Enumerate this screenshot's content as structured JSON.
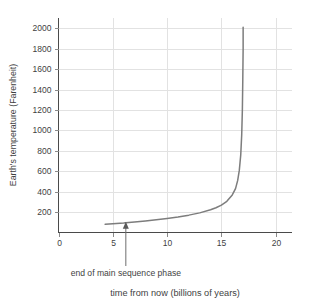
{
  "chart_data": {
    "type": "line",
    "title": "",
    "subtitle": "",
    "xlabel": "time from now (billions of years)",
    "ylabel": "Earth's temperature (Farenheit)",
    "xlim": [
      0,
      21.5
    ],
    "ylim": [
      0,
      2100
    ],
    "xticks": [
      0,
      5,
      10,
      15,
      20
    ],
    "xtick_labels": [
      "0",
      "5",
      "10",
      "15",
      "20"
    ],
    "yticks": [
      200,
      400,
      600,
      800,
      1000,
      1200,
      1400,
      1600,
      1800,
      2000
    ],
    "ytick_labels": [
      "200",
      "400",
      "600",
      "800",
      "1000",
      "1200",
      "1400",
      "1600",
      "1800",
      "2000"
    ],
    "grid": "both",
    "legend": "none",
    "series": [
      {
        "name": "Earth's temperature",
        "x": [
          4.3,
          5.0,
          6.0,
          6.2,
          7.0,
          8.0,
          9.0,
          10.0,
          11.0,
          12.0,
          13.0,
          14.0,
          14.5,
          15.0,
          15.5,
          16.0,
          16.3,
          16.5,
          16.65,
          16.78,
          16.87,
          16.93,
          16.97,
          17.0,
          17.0
        ],
        "y": [
          80,
          85,
          92,
          95,
          102,
          112,
          124,
          137,
          152,
          170,
          192,
          222,
          242,
          268,
          305,
          368,
          430,
          510,
          610,
          760,
          960,
          1200,
          1500,
          1800,
          2010
        ]
      }
    ],
    "annotations": [
      {
        "label": "end of main sequence phase",
        "x": 6.2,
        "y": 95,
        "arrow": "up"
      }
    ],
    "colors": {
      "curve": "#7d7d7d",
      "axis": "#4a4a4a",
      "grid": "#e2e2e2",
      "text": "#3f3f3f",
      "background": "#ffffff"
    }
  }
}
